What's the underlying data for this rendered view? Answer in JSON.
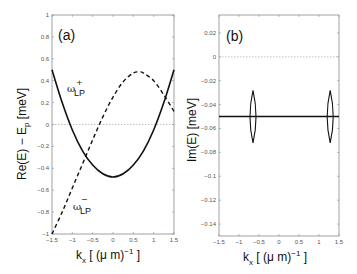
{
  "chart_data": [
    {
      "type": "line",
      "panel_label": "(a)",
      "xlabel": "k_x [ (μ m)^-1 ]",
      "ylabel": "Re(E) − E_p [meV]",
      "xlim": [
        -1.5,
        1.5
      ],
      "ylim": [
        -1,
        1
      ],
      "x_ticks": [
        "-1.5",
        "-1",
        "-0.5",
        "0",
        "0.5",
        "1",
        "1.5"
      ],
      "y_ticks": [
        "-1",
        "-0.8",
        "-0.6",
        "-0.4",
        "-0.2",
        "0",
        "0.2",
        "0.4",
        "0.6",
        "0.8",
        "1"
      ],
      "grid": false,
      "reference_line": {
        "y": 0,
        "style": "dotted",
        "color": "#999999"
      },
      "annotations": [
        "ω⁺_LP",
        "ω⁻_LP"
      ],
      "series": [
        {
          "name": "ω+_LP",
          "style": "solid",
          "x": [
            -1.5,
            -1.25,
            -1.0,
            -0.75,
            -0.5,
            -0.25,
            0,
            0.25,
            0.5,
            0.75,
            1.0,
            1.25,
            1.5
          ],
          "y": [
            0.5,
            0.2,
            -0.05,
            -0.24,
            -0.37,
            -0.45,
            -0.48,
            -0.45,
            -0.37,
            -0.24,
            -0.05,
            0.2,
            0.5
          ]
        },
        {
          "name": "ω−_LP",
          "style": "dashed",
          "x": [
            -1.5,
            -1.25,
            -1.0,
            -0.75,
            -0.5,
            -0.25,
            0,
            0.25,
            0.5,
            0.65,
            0.75,
            1.0,
            1.25,
            1.5
          ],
          "y": [
            -1.0,
            -0.8,
            -0.58,
            -0.36,
            -0.14,
            0.07,
            0.25,
            0.39,
            0.47,
            0.48,
            0.47,
            0.4,
            0.27,
            0.12
          ]
        }
      ]
    },
    {
      "type": "line",
      "panel_label": "(b)",
      "xlabel": "k_x [ (μ m)^-1 ]",
      "ylabel": "Im(E) [meV]",
      "xlim": [
        -1.5,
        1.5
      ],
      "ylim": [
        -0.15,
        0.035
      ],
      "x_ticks": [
        "-1.5",
        "-1",
        "-0.5",
        "0",
        "0.5",
        "1",
        "1.5"
      ],
      "y_ticks": [
        "-0.14",
        "-0.12",
        "-0.1",
        "-0.08",
        "-0.06",
        "-0.04",
        "-0.02",
        "0",
        "0.02"
      ],
      "grid": false,
      "reference_line": {
        "y": 0,
        "style": "dotted",
        "color": "#999999"
      },
      "series": [
        {
          "name": "Im(E)",
          "style": "solid",
          "x": [
            -1.5,
            1.5
          ],
          "y": [
            -0.05,
            -0.05
          ]
        }
      ],
      "features": [
        {
          "type": "lens",
          "x": -0.65,
          "y_range": [
            -0.072,
            -0.028
          ]
        },
        {
          "type": "lens",
          "x": 1.28,
          "y_range": [
            -0.072,
            -0.028
          ]
        }
      ]
    }
  ],
  "labels": {
    "panel_a": "(a)",
    "panel_b": "(b)",
    "ylabel_a_main": "Re(E) − E",
    "ylabel_a_sub": "p",
    "ylabel_a_unit": " [meV]",
    "ylabel_b": "Im(E) [meV]",
    "xlabel_k": "k",
    "xlabel_sub": "x",
    "xlabel_mid": " [ (μ m)",
    "xlabel_sup": "−1",
    "xlabel_end": " ]",
    "omega": "ω",
    "lp": "LP",
    "plus": "+",
    "minus": "−"
  }
}
